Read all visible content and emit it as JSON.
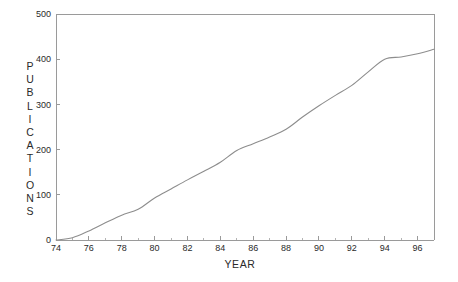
{
  "chart_data": {
    "type": "line",
    "title": "",
    "xlabel": "YEAR",
    "ylabel": "PUBLICATIONS",
    "ylabel_chars": [
      "P",
      "U",
      "B",
      "L",
      "I",
      "C",
      "A",
      "T",
      "I",
      "O",
      "N",
      "S"
    ],
    "xlim": [
      74,
      97
    ],
    "ylim": [
      0,
      500
    ],
    "grid": false,
    "legend": null,
    "line_color": "#8d8d8d",
    "axis_color": "#9a9a9a",
    "x_ticks_major": [
      74,
      76,
      78,
      80,
      82,
      84,
      86,
      88,
      90,
      92,
      94,
      96
    ],
    "x_tick_labels": [
      "74",
      "76",
      "78",
      "80",
      "82",
      "84",
      "86",
      "88",
      "90",
      "92",
      "94",
      "96"
    ],
    "x_ticks_minor": [
      75,
      77,
      79,
      81,
      83,
      85,
      87,
      89,
      91,
      93,
      95
    ],
    "y_ticks_major": [
      0,
      100,
      200,
      300,
      400,
      500
    ],
    "y_tick_labels": [
      "0",
      "100",
      "200",
      "300",
      "400",
      "500"
    ],
    "x": [
      74,
      75,
      76,
      77,
      78,
      79,
      80,
      81,
      82,
      83,
      84,
      85,
      86,
      87,
      88,
      89,
      90,
      91,
      92,
      93,
      94,
      95,
      96,
      97
    ],
    "values": [
      0,
      5,
      20,
      38,
      55,
      68,
      93,
      113,
      133,
      152,
      172,
      198,
      213,
      228,
      245,
      272,
      297,
      320,
      342,
      372,
      400,
      405,
      412,
      422
    ],
    "series": [
      {
        "name": "Publications",
        "values": [
          0,
          5,
          20,
          38,
          55,
          68,
          93,
          113,
          133,
          152,
          172,
          198,
          213,
          228,
          245,
          272,
          297,
          320,
          342,
          372,
          400,
          405,
          412,
          422
        ]
      }
    ]
  },
  "geometry": {
    "plot_left": 56,
    "plot_right": 434,
    "plot_top": 14,
    "plot_bottom": 240
  }
}
